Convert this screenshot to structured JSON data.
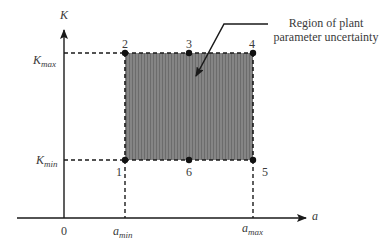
{
  "diagram": {
    "title": "Region of plant parameter uncertainty",
    "annotation": {
      "line1": "Region of plant",
      "line2": "parameter uncertainty"
    },
    "axes": {
      "x_label": "a",
      "y_label": "K",
      "origin_label": "0",
      "x_ticks": [
        {
          "base": "a",
          "sub": "min"
        },
        {
          "base": "a",
          "sub": "max"
        }
      ],
      "y_ticks": [
        {
          "base": "K",
          "sub": "max"
        },
        {
          "base": "K",
          "sub": "min"
        }
      ]
    },
    "vertices": [
      {
        "id": "1",
        "label": "1",
        "position": "(a_min, K_min)"
      },
      {
        "id": "2",
        "label": "2",
        "position": "(a_min, K_max)"
      },
      {
        "id": "3",
        "label": "3",
        "position": "(a_mid, K_max)"
      },
      {
        "id": "4",
        "label": "4",
        "position": "(a_max, K_max)"
      },
      {
        "id": "5",
        "label": "5",
        "position": "(a_max, K_min)"
      },
      {
        "id": "6",
        "label": "6",
        "position": "(a_mid, K_min)"
      }
    ],
    "colors": {
      "region_fill": "#7d7d7d",
      "stroke": "#1a1a1a",
      "text": "#3a3a3a"
    }
  }
}
